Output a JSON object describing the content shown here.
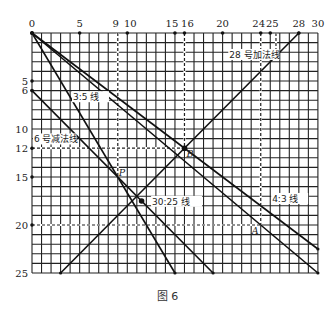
{
  "caption": "图 6",
  "grid": {
    "cols": 30,
    "rows": 25,
    "origin_px": [
      32,
      33
    ],
    "cell_w": 9.53,
    "cell_h": 9.6,
    "top_ticks": [
      0,
      5,
      9,
      10,
      15,
      16,
      20,
      24,
      25,
      28,
      30
    ],
    "top_dots": [
      5,
      10,
      15,
      16,
      20,
      24,
      25,
      28
    ],
    "left_ticks": [
      5,
      6,
      10,
      12,
      15,
      20,
      25
    ],
    "left_dots": [
      5,
      6,
      12,
      15,
      20
    ]
  },
  "lines": [
    {
      "name": "line-4-3",
      "label": "4:3 线",
      "from": [
        0,
        0
      ],
      "to": [
        30,
        22.5
      ],
      "label_at": [
        25.2,
        17.6
      ]
    },
    {
      "name": "line-30-25",
      "label": "30:25 线",
      "from": [
        0,
        0
      ],
      "to": [
        30,
        25
      ],
      "label_at": [
        12.6,
        17.9
      ]
    },
    {
      "name": "line-3-5",
      "label": "3:5 线",
      "from": [
        0,
        0
      ],
      "to": [
        15,
        25
      ],
      "label_at": [
        4.3,
        7.0
      ]
    },
    {
      "name": "line-6-subtract",
      "label": "6 号减法线",
      "from": [
        0,
        6
      ],
      "to": [
        19,
        25
      ],
      "label_at": [
        0.2,
        11.4
      ]
    },
    {
      "name": "line-28-add",
      "label": "28 号加法线",
      "from": [
        28,
        0
      ],
      "to": [
        3,
        25
      ],
      "label_at": [
        20.7,
        2.6
      ]
    }
  ],
  "dashed": [
    {
      "from": [
        9,
        0
      ],
      "to": [
        9,
        15
      ]
    },
    {
      "from": [
        16,
        0
      ],
      "to": [
        16,
        12
      ]
    },
    {
      "from": [
        24,
        0
      ],
      "to": [
        24,
        20
      ]
    },
    {
      "from": [
        25.6,
        0
      ],
      "to": [
        25.6,
        2.4
      ]
    },
    {
      "from": [
        0,
        12
      ],
      "to": [
        16,
        12
      ]
    },
    {
      "from": [
        0,
        20
      ],
      "to": [
        24,
        20
      ]
    }
  ],
  "points": [
    {
      "name": "P",
      "label": "P",
      "at": [
        9,
        15
      ],
      "dot": false,
      "label_off": [
        1,
        -1
      ]
    },
    {
      "name": "B",
      "label": "B",
      "at": [
        16,
        12
      ],
      "dot": true,
      "label_off": [
        2,
        9
      ]
    },
    {
      "name": "A",
      "label": "A",
      "at": [
        24,
        20
      ],
      "dot": false,
      "label_off": [
        -9,
        9
      ]
    },
    {
      "name": "intersection",
      "label": "",
      "at": [
        11.5,
        17.5
      ],
      "dot": true,
      "label_off": [
        0,
        0
      ]
    }
  ]
}
